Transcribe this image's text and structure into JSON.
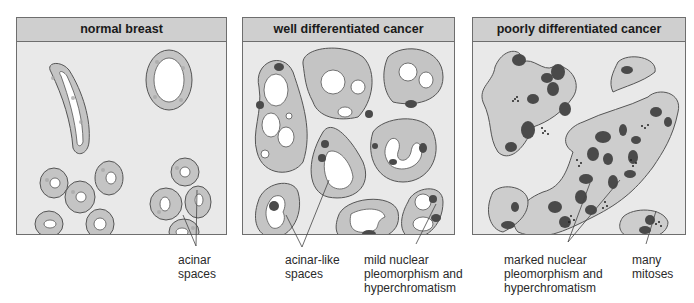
{
  "panels": [
    {
      "id": "normal",
      "title": "normal breast"
    },
    {
      "id": "well",
      "title": "well differentiated cancer"
    },
    {
      "id": "poorly",
      "title": "poorly differentiated cancer"
    }
  ],
  "labels": {
    "acinar_spaces": [
      "acinar",
      "spaces"
    ],
    "acinar_like_spaces": [
      "acinar-like",
      "spaces"
    ],
    "mild_nuclear": [
      "mild nuclear",
      "pleomorphism and",
      "hyperchromatism"
    ],
    "marked_nuclear": [
      "marked nuclear",
      "pleomorphism and",
      "hyperchromatism"
    ],
    "many_mitoses": [
      "many",
      "mitoses"
    ]
  },
  "colors": {
    "panel_bg": "#e9e9e9",
    "header_bg": "#cfcfcf",
    "cell_fill": "#c4c4c4",
    "lumen": "#ffffff",
    "nucleus": "#4a4a4a",
    "outline": "#555555"
  }
}
